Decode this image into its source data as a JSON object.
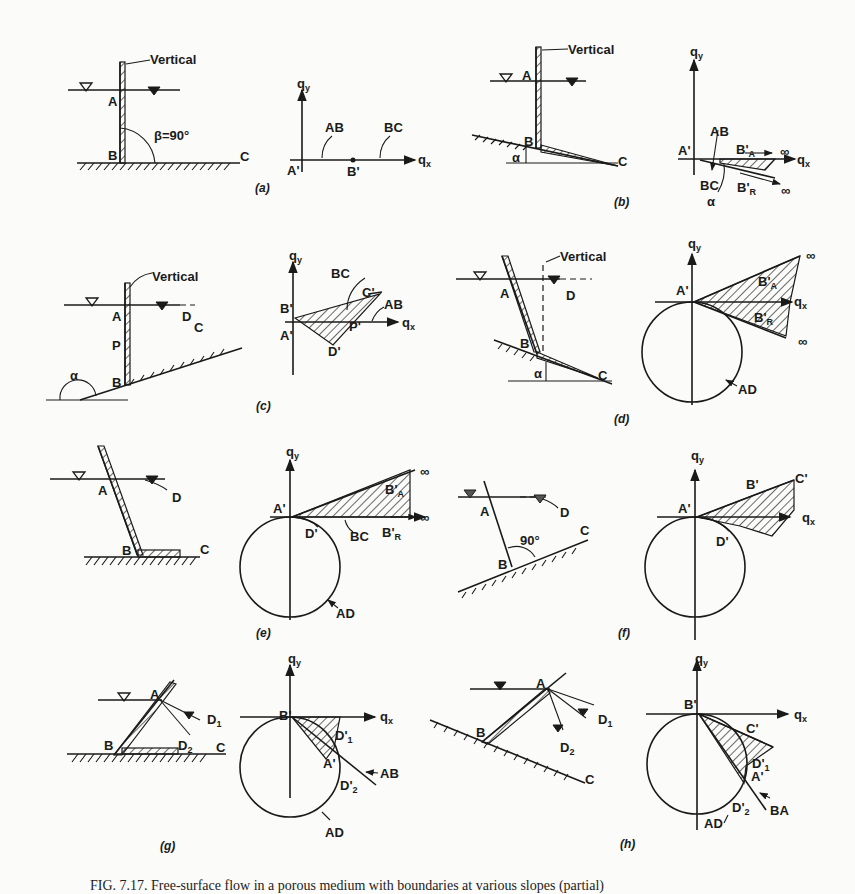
{
  "figure": {
    "panels": [
      {
        "id": "a",
        "caption": "(a)",
        "physical_labels": [
          "Vertical",
          "A",
          "B",
          "C",
          "β=90°"
        ],
        "hodograph_labels": [
          "qy",
          "qx",
          "A'",
          "B'",
          "AB",
          "BC"
        ]
      },
      {
        "id": "b",
        "caption": "(b)",
        "physical_labels": [
          "Vertical",
          "A",
          "B",
          "C",
          "α"
        ],
        "hodograph_labels": [
          "qy",
          "qx",
          "A'",
          "AB",
          "BC",
          "B'A",
          "B'R",
          "∞",
          "∞",
          "α"
        ]
      },
      {
        "id": "c",
        "caption": "(c)",
        "physical_labels": [
          "Vertical",
          "A",
          "P",
          "B",
          "C",
          "D",
          "α"
        ],
        "hodograph_labels": [
          "qy",
          "qx",
          "B'",
          "A'",
          "C'",
          "P'",
          "D'",
          "BC",
          "AB"
        ]
      },
      {
        "id": "d",
        "caption": "(d)",
        "physical_labels": [
          "Vertical",
          "A",
          "B",
          "C",
          "D",
          "α"
        ],
        "hodograph_labels": [
          "qy",
          "qx",
          "A'",
          "B'A",
          "B'R",
          "∞",
          "∞",
          "AD"
        ]
      },
      {
        "id": "e",
        "caption": "(e)",
        "physical_labels": [
          "A",
          "B",
          "C",
          "D"
        ],
        "hodograph_labels": [
          "qy",
          "qx",
          "A'",
          "D'",
          "B'A",
          "B'R",
          "BC",
          "∞",
          "∞",
          "AD"
        ]
      },
      {
        "id": "f",
        "caption": "(f)",
        "physical_labels": [
          "A",
          "B",
          "C",
          "D",
          "90°"
        ],
        "hodograph_labels": [
          "qy",
          "qx",
          "A'",
          "B'",
          "C'",
          "D'"
        ]
      },
      {
        "id": "g",
        "caption": "(g)",
        "physical_labels": [
          "A",
          "B",
          "C",
          "D1",
          "D2"
        ],
        "hodograph_labels": [
          "qy",
          "qx",
          "B'",
          "A'",
          "D'1",
          "D'2",
          "AB",
          "AD"
        ]
      },
      {
        "id": "h",
        "caption": "(h)",
        "physical_labels": [
          "A",
          "B",
          "C",
          "D1",
          "D2"
        ],
        "hodograph_labels": [
          "qy",
          "qx",
          "B'",
          "C'",
          "A'",
          "D'1",
          "D'2",
          "BA",
          "AD"
        ]
      }
    ],
    "caption_text": "FIG. 7.17. Free-surface flow in a porous medium with boundaries at various slopes (partial)"
  },
  "text": {
    "vertical": "Vertical",
    "A": "A",
    "B": "B",
    "C": "C",
    "D": "D",
    "P": "P",
    "D1": "D",
    "D2": "D",
    "sub1": "1",
    "sub2": "2",
    "beta": "β=90°",
    "alpha": "α",
    "deg90": "90°",
    "qy": "q",
    "qx": "q",
    "y": "y",
    "x": "x",
    "Ap": "A'",
    "Bp": "B'",
    "Cp": "C'",
    "Dp": "D'",
    "Pp": "P'",
    "AB": "AB",
    "BC": "BC",
    "AD": "AD",
    "BA": "BA",
    "inf": "∞",
    "subA": "A",
    "subR": "R",
    "cap_a": "(a)",
    "cap_b": "(b)",
    "cap_c": "(c)",
    "cap_d": "(d)",
    "cap_e": "(e)",
    "cap_f": "(f)",
    "cap_g": "(g)",
    "cap_h": "(h)"
  }
}
